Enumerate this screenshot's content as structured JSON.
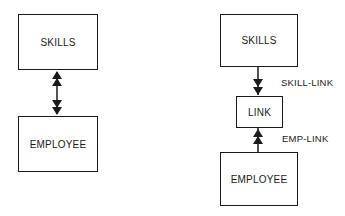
{
  "left_diagram": {
    "top_box": {
      "label": "SKILLS"
    },
    "bottom_box": {
      "label": "EMPLOYEE"
    },
    "relationship": {
      "type": "many-to-many",
      "arrows": "double-headed both directions"
    }
  },
  "right_diagram": {
    "top_box": {
      "label": "SKILLS"
    },
    "middle_box": {
      "label": "LINK"
    },
    "bottom_box": {
      "label": "EMPLOYEE"
    },
    "upper_link": {
      "label": "SKILL-LINK",
      "from": "SKILLS",
      "to": "LINK"
    },
    "lower_link": {
      "label": "EMP-LINK",
      "from": "EMPLOYEE",
      "to": "LINK"
    }
  },
  "colors": {
    "ink": "#1a1a1a",
    "background": "#ffffff"
  }
}
